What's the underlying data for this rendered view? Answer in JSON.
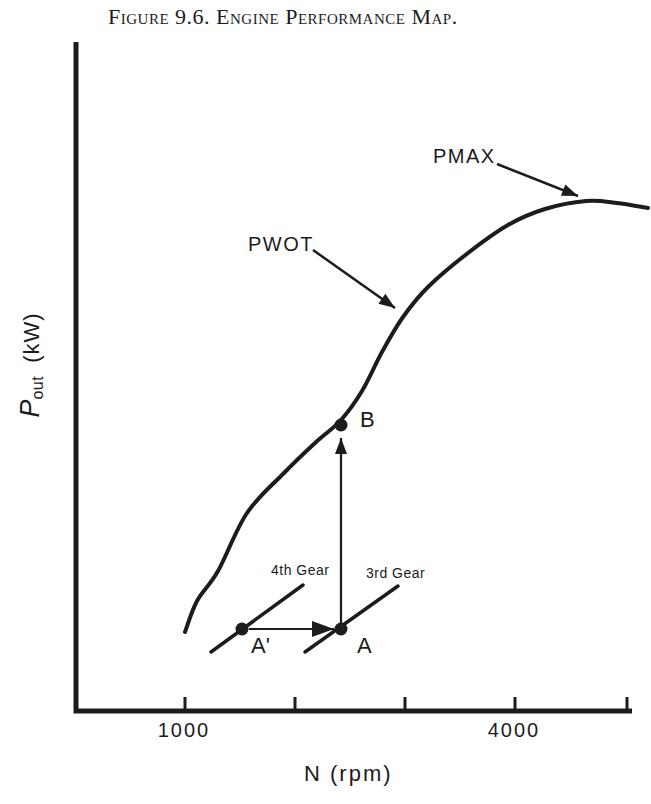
{
  "title": "Figure 9.6. Engine Performance Map.",
  "labels": {
    "pmax": "PMAX",
    "pwot": "PWOT",
    "point_b": "B",
    "point_a": "A",
    "point_a_prime": "A'",
    "gear4": "4th Gear",
    "gear3": "3rd Gear",
    "tick_1000": "1000",
    "tick_4000": "4000",
    "xlabel": "N (rpm)",
    "ylabel_p": "P",
    "ylabel_sub": "out",
    "ylabel_unit": "(kW)"
  },
  "colors": {
    "ink": "#1c1c1c",
    "background": "#ffffff"
  },
  "chart_data": {
    "type": "line",
    "title": "Figure 9.6. Engine Performance Map.",
    "xlabel": "N (rpm)",
    "ylabel": "P_out (kW)",
    "x_ticks_rpm": [
      1000,
      2000,
      3000,
      4000,
      5000
    ],
    "x_tick_labels_shown": [
      "1000",
      "4000"
    ],
    "xlim_rpm": [
      0,
      5050
    ],
    "ylabel_note": "y axis qualitative, no numeric scale shown",
    "grid": false,
    "legend": "none",
    "series": [
      {
        "name": "PWOT wide-open-throttle power curve",
        "x_rpm": [
          1000,
          1300,
          1570,
          1750,
          2180,
          2420,
          2780,
          2980,
          3210,
          3590,
          3940,
          4270,
          4645,
          5000,
          5210
        ],
        "p_relative": [
          16,
          28,
          39,
          47,
          57,
          60,
          71,
          77,
          83,
          90,
          95,
          98,
          100,
          99.4,
          98.6
        ]
      }
    ],
    "annotations": [
      {
        "label": "PMAX",
        "rpm": 4645,
        "note": "arrow pointing to peak of PWOT curve"
      },
      {
        "label": "PWOT",
        "rpm": 2930,
        "note": "arrow pointing to curve"
      },
      {
        "label": "A",
        "rpm": 2420,
        "note": "operating point on 3rd Gear line"
      },
      {
        "label": "A'",
        "rpm": 1520,
        "note": "operating point on 4th Gear line"
      },
      {
        "label": "B",
        "rpm": 2420,
        "note": "point on PWOT curve reached by upshift arrow from A"
      },
      {
        "label": "3rd Gear",
        "note": "short diagonal gear load line through A"
      },
      {
        "label": "4th Gear",
        "note": "short diagonal gear load line through A'"
      }
    ]
  },
  "geometry": {
    "axes": {
      "points": [
        [
          76,
          42
        ],
        [
          76,
          711
        ],
        [
          632,
          711
        ]
      ],
      "w": 5
    },
    "ticks": {
      "xs": [
        185,
        295,
        405,
        515,
        627
      ],
      "y1": 711,
      "y2": 697,
      "w": 3
    },
    "curve": {
      "points": [
        [
          185,
          632
        ],
        [
          197,
          601
        ],
        [
          218,
          571
        ],
        [
          247,
          513
        ],
        [
          284,
          473
        ],
        [
          315,
          443
        ],
        [
          341,
          420
        ],
        [
          362,
          391
        ],
        [
          382,
          352
        ],
        [
          403,
          317
        ],
        [
          428,
          287
        ],
        [
          468,
          253
        ],
        [
          508,
          225
        ],
        [
          545,
          209
        ],
        [
          586,
          201
        ],
        [
          617,
          203
        ],
        [
          648,
          208
        ]
      ],
      "w": 4
    },
    "arrows": [
      {
        "name": "pwot-arrow",
        "x1": 313,
        "y1": 250,
        "x2": 395,
        "y2": 308,
        "w": 2.5,
        "head": "normal"
      },
      {
        "name": "pmax-arrow",
        "x1": 497,
        "y1": 164,
        "x2": 578,
        "y2": 196,
        "w": 2.5,
        "head": "normal"
      },
      {
        "name": "upshift-arrow",
        "x1": 341,
        "y1": 628,
        "x2": 341,
        "y2": 438,
        "w": 2.2,
        "head": "normal"
      },
      {
        "name": "downshift-arrow",
        "x1": 249,
        "y1": 629,
        "x2": 334,
        "y2": 629,
        "w": 2.2,
        "head": "big"
      }
    ],
    "lines": [
      {
        "name": "gear4-line",
        "x1": 211,
        "y1": 652,
        "x2": 303,
        "y2": 585,
        "w": 3.5
      },
      {
        "name": "gear3-line",
        "x1": 305,
        "y1": 652,
        "x2": 398,
        "y2": 586,
        "w": 3.5
      }
    ],
    "dots": [
      {
        "name": "point-a-prime-dot",
        "cx": 242,
        "cy": 629,
        "r": 6.5
      },
      {
        "name": "point-a-dot",
        "cx": 341,
        "cy": 629,
        "r": 6.5
      },
      {
        "name": "point-b-dot",
        "cx": 341,
        "cy": 425,
        "r": 6.5
      }
    ]
  }
}
